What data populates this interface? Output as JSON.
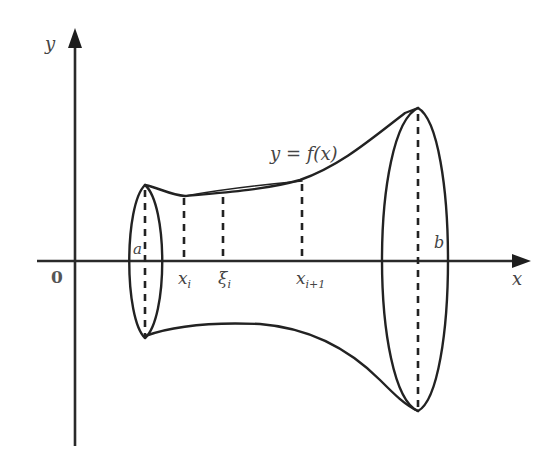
{
  "figure": {
    "axes": {
      "x_label": "x",
      "y_label": "y",
      "origin_label": "0"
    },
    "curve_label": "y = f(x)",
    "endpoints": {
      "left": "a",
      "right": "b"
    },
    "partition_labels": {
      "x_i": "x",
      "x_i_sub": "i",
      "xi_i": "ξ",
      "xi_i_sub": "i",
      "x_i1": "x",
      "x_i1_sub": "i+1"
    },
    "colors": {
      "stroke": "#222222",
      "label": "#444444",
      "background": "#ffffff"
    }
  }
}
